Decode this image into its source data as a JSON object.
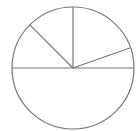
{
  "chart_data": {
    "type": "pie",
    "title": "",
    "categories": [
      "A",
      "B",
      "C",
      "D",
      "E"
    ],
    "values": [
      5.4,
      19.6,
      12.5,
      12.5,
      50
    ],
    "start_angle_deg": 0,
    "direction": "counterclockwise",
    "labels_visible": false,
    "legend": null,
    "fill": "none",
    "stroke_color": "#777777",
    "background": "#ffffff",
    "center": [
      73,
      68
    ],
    "radius": 61
  }
}
